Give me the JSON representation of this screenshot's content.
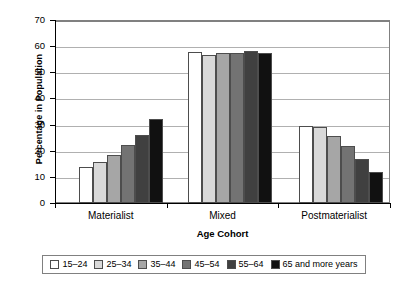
{
  "chart_data": {
    "type": "bar",
    "title": "",
    "subtitle": "",
    "xlabel": "Age Cohort",
    "ylabel": "Percentage in Population",
    "categories": [
      "Materialist",
      "Mixed",
      "Postmaterialist"
    ],
    "ylim": [
      0,
      70
    ],
    "yticks": [
      0,
      10,
      20,
      30,
      40,
      50,
      60,
      70
    ],
    "ytick_labels": [
      "0",
      "10",
      "20",
      "30",
      "40",
      "50",
      "60",
      "70"
    ],
    "grid": true,
    "legend_position": "bottom",
    "series": [
      {
        "name": "15–24",
        "color": "#ffffff",
        "values": [
          13.8,
          57.7,
          29.6
        ]
      },
      {
        "name": "25–34",
        "color": "#d9d9d9",
        "values": [
          15.8,
          56.5,
          29.0
        ]
      },
      {
        "name": "35–44",
        "color": "#a6a6a6",
        "values": [
          18.2,
          57.5,
          25.5
        ]
      },
      {
        "name": "45–54",
        "color": "#737373",
        "values": [
          22.3,
          57.3,
          21.8
        ]
      },
      {
        "name": "55–64",
        "color": "#404040",
        "values": [
          26.0,
          58.2,
          17.0
        ]
      },
      {
        "name": "65 and more years",
        "color": "#111111",
        "values": [
          32.2,
          57.2,
          11.7
        ]
      }
    ]
  },
  "style": {
    "bar_border": "#4d4d4d",
    "gridline_color": "#b0b0b0",
    "frame_color": "#808080",
    "axis_color": "#000000",
    "background": "#ffffff"
  }
}
